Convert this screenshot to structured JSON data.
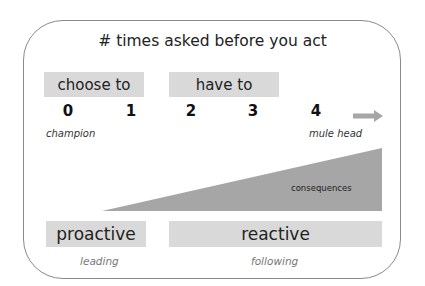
{
  "diagram": {
    "title": "# times asked before you act",
    "top_labels": [
      {
        "label": "choose to"
      },
      {
        "label": "have to"
      }
    ],
    "scale": {
      "numbers": [
        "0",
        "1",
        "2",
        "3",
        "4"
      ],
      "left_caption": "champion",
      "right_caption": "mule head",
      "arrow": "right-arrow-icon"
    },
    "wedge": {
      "label": "consequences",
      "color": "#a6a6a6"
    },
    "bottom_labels": [
      {
        "label": "proactive",
        "caption": "leading"
      },
      {
        "label": "reactive",
        "caption": "following"
      }
    ],
    "colors": {
      "box_fill": "#d9d9d9",
      "frame_border": "#8a8a8a",
      "arrow": "#a6a6a6"
    }
  }
}
